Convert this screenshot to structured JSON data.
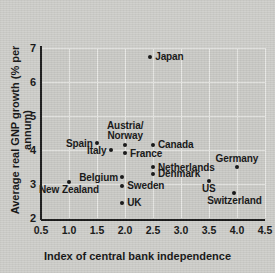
{
  "chart_data": {
    "type": "scatter",
    "title": "",
    "xlabel": "Index of central bank independence",
    "ylabel": "Average real GNP growth (% per annum)",
    "xlim": [
      0.5,
      4.5
    ],
    "ylim": [
      2,
      7
    ],
    "xticks": [
      "0.5",
      "1.0",
      "1.5",
      "2.0",
      "2.5",
      "3.0",
      "3.5",
      "4.0",
      "4.5"
    ],
    "xtick_values": [
      0.5,
      1.0,
      1.5,
      2.0,
      2.5,
      3.0,
      3.5,
      4.0,
      4.5
    ],
    "yticks": [
      "2",
      "3",
      "4",
      "5",
      "6",
      "7"
    ],
    "ytick_values": [
      2,
      3,
      4,
      5,
      6,
      7
    ],
    "grid": true,
    "legend": "none",
    "points": [
      {
        "label": "Japan",
        "x": 2.45,
        "y": 6.75,
        "label_pos": "right"
      },
      {
        "label": "Spain",
        "x": 1.5,
        "y": 4.2,
        "label_pos": "left"
      },
      {
        "label": "Austria/\nNorway",
        "x": 2.0,
        "y": 4.15,
        "label_pos": "above",
        "lines": [
          "Austria/",
          "Norway"
        ]
      },
      {
        "label": "Canada",
        "x": 2.5,
        "y": 4.15,
        "label_pos": "right"
      },
      {
        "label": "Italy",
        "x": 1.75,
        "y": 4.0,
        "label_pos": "left"
      },
      {
        "label": "France",
        "x": 2.0,
        "y": 3.9,
        "label_pos": "right"
      },
      {
        "label": "Netherlands",
        "x": 2.5,
        "y": 3.5,
        "label_pos": "right"
      },
      {
        "label": "Germany",
        "x": 4.0,
        "y": 3.5,
        "label_pos": "above"
      },
      {
        "label": "Denmark",
        "x": 2.5,
        "y": 3.3,
        "label_pos": "right"
      },
      {
        "label": "Belgium",
        "x": 1.95,
        "y": 3.2,
        "label_pos": "left"
      },
      {
        "label": "US",
        "x": 3.5,
        "y": 3.1,
        "label_pos": "below"
      },
      {
        "label": "New Zealand",
        "x": 1.0,
        "y": 3.05,
        "label_pos": "below"
      },
      {
        "label": "Sweden",
        "x": 1.95,
        "y": 2.95,
        "label_pos": "right"
      },
      {
        "label": "Switzerland",
        "x": 3.95,
        "y": 2.75,
        "label_pos": "below"
      },
      {
        "label": "UK",
        "x": 1.95,
        "y": 2.45,
        "label_pos": "right"
      }
    ],
    "colors": {
      "marker": "#141414",
      "plot_background": "#cbcbc7",
      "page_background": "#cfcfcb",
      "gridline": "#e9e9e6",
      "axis": "#1a1a1a"
    }
  }
}
